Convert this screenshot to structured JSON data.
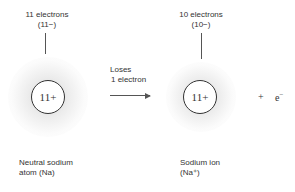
{
  "left_atom": {
    "electrons_label": "11 electrons",
    "charge_label": "(11−)",
    "nucleus_label": "11+",
    "caption_line1": "Neutral sodium",
    "caption_line2": "atom (Na)"
  },
  "reaction": {
    "arrow_label_line1": "Loses",
    "arrow_label_line2": "1 electron"
  },
  "right_ion": {
    "electrons_label": "10 electrons",
    "charge_label": "(10−)",
    "nucleus_label": "11+",
    "caption_line1": "Sodium ion",
    "caption_line2": "(Na⁺)"
  },
  "product": {
    "plus_sign": "+",
    "electron_symbol": "e",
    "electron_charge": "−"
  }
}
